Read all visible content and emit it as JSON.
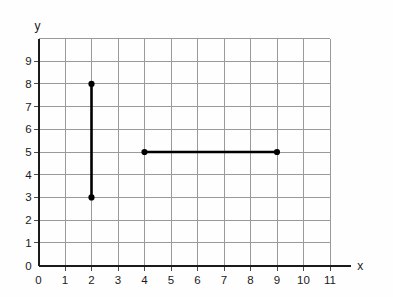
{
  "chart_data": {
    "type": "scatter",
    "title": "",
    "xlabel": "x",
    "ylabel": "y",
    "xlim": [
      0,
      11.8
    ],
    "ylim": [
      0,
      10
    ],
    "grid": true,
    "legend": null,
    "x_ticks": [
      "0",
      "1",
      "2",
      "3",
      "4",
      "5",
      "6",
      "7",
      "8",
      "9",
      "10",
      "11"
    ],
    "y_ticks": [
      "0",
      "1",
      "2",
      "3",
      "4",
      "5",
      "6",
      "7",
      "8",
      "9"
    ],
    "x_tick_values": [
      0,
      1,
      2,
      3,
      4,
      5,
      6,
      7,
      8,
      9,
      10,
      11
    ],
    "y_tick_values": [
      0,
      1,
      2,
      3,
      4,
      5,
      6,
      7,
      8,
      9
    ],
    "grid_x_lines": [
      0,
      1,
      2,
      3,
      4,
      5,
      6,
      7,
      8,
      9,
      10,
      11
    ],
    "grid_y_lines": [
      0,
      1,
      2,
      3,
      4,
      5,
      6,
      7,
      8,
      9,
      10
    ],
    "segments": [
      {
        "name": "vertical-segment",
        "x1": 2,
        "y1": 3,
        "x2": 2,
        "y2": 8,
        "color": "#000000",
        "endpoints": [
          [
            2,
            3
          ],
          [
            2,
            8
          ]
        ],
        "length": 5,
        "orientation": "vertical"
      },
      {
        "name": "horizontal-segment",
        "x1": 4,
        "y1": 5,
        "x2": 9,
        "y2": 5,
        "color": "#000000",
        "endpoints": [
          [
            4,
            5
          ],
          [
            9,
            5
          ]
        ],
        "length": 5,
        "orientation": "horizontal"
      }
    ],
    "points": [
      {
        "x": 2,
        "y": 8,
        "label": ""
      },
      {
        "x": 2,
        "y": 3,
        "label": ""
      },
      {
        "x": 4,
        "y": 5,
        "label": ""
      },
      {
        "x": 9,
        "y": 5,
        "label": ""
      }
    ]
  },
  "axes": {
    "x_axis_label": "x",
    "y_axis_label": "y"
  },
  "colors": {
    "grid": "#9a9a9a",
    "axis": "#1a1a1a",
    "data": "#000000",
    "background": "#fefefe"
  }
}
